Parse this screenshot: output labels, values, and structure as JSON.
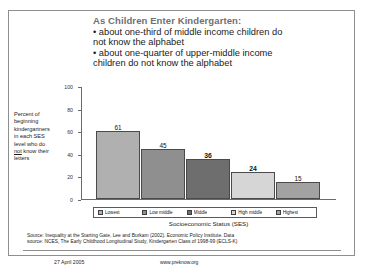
{
  "headline": {
    "title": "As Children Enter Kindergarten:",
    "bullets": [
      "• about one-third of middle income children do",
      "not know the alphabet",
      "• about one-quarter of upper-middle income",
      "children do not know the alphabet"
    ]
  },
  "y_caption": {
    "line1": "Percent of",
    "line2": "beginning",
    "line3": "kindergartners",
    "line4": "in each SES",
    "line5": "level who do",
    "line6_pre": "",
    "line6_underline": "not",
    "line6_post": " know their",
    "line7": "letters"
  },
  "legend": {
    "items": [
      {
        "label": "Lowest",
        "color": "#b0b0b0"
      },
      {
        "label": "Low middle",
        "color": "#8f8f8f"
      },
      {
        "label": "Middle",
        "color": "#6e6e6e"
      },
      {
        "label": "High middle",
        "color": "#d6d6d6"
      },
      {
        "label": "Highest",
        "color": "#a2a2a2"
      }
    ]
  },
  "source": {
    "line1": "Source: Inequality at the Starting Gate, Lee and Burkam (2002). Economic Policy Institute. Data",
    "line2": "source: NCES, The Early Childhood Longitudinal Study, Kindergarten Class of 1998-99 (ECLS-K)"
  },
  "footer": {
    "date": "27 April 2005",
    "url": "www.preknow.org"
  },
  "chart_data": {
    "type": "bar",
    "title": "As Children Enter Kindergarten:",
    "categories": [
      "Lowest",
      "Low middle",
      "Middle",
      "High middle",
      "Highest"
    ],
    "values": [
      61,
      45,
      36,
      24,
      15
    ],
    "value_labels": [
      "61",
      "45",
      "36",
      "24",
      "15"
    ],
    "xlabel": "Socioeconomic Status (SES)",
    "ylabel": "Percent of beginning kindergartners in each SES level who do not know their letters",
    "ylim": [
      0,
      100
    ],
    "yticks": [
      100,
      80,
      60,
      40,
      20,
      0
    ],
    "ytick_labels": [
      "100",
      "80",
      "60",
      "40",
      "20",
      "0"
    ],
    "grid": false,
    "legend_position": "bottom",
    "bar_colors": [
      "#b0b0b0",
      "#8f8f8f",
      "#6e6e6e",
      "#d6d6d6",
      "#a2a2a2"
    ]
  }
}
